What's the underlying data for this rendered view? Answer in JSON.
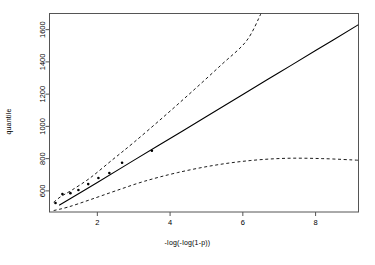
{
  "chart_data": {
    "type": "scatter",
    "title": "",
    "subtitle": "",
    "xlabel": "-log(-log(1-p))",
    "ylabel": "quantile",
    "xlim": [
      0.685,
      9.18
    ],
    "ylim": [
      469,
      1700
    ],
    "grid": false,
    "legend": null,
    "xticks": [
      2,
      4,
      6,
      8
    ],
    "xtick_labels": [
      "2",
      "4",
      "6",
      "8"
    ],
    "yticks": [
      600,
      800,
      1000,
      1200,
      1400,
      1600
    ],
    "ytick_labels": [
      "600",
      "800",
      "1000",
      "1200",
      "1400",
      "1600"
    ],
    "box": true,
    "series": [
      {
        "name": "observed quantiles",
        "type": "scatter",
        "marker": "filled-circle",
        "color": "#000000",
        "points": [
          {
            "x": 0.85,
            "y": 525
          },
          {
            "x": 1.04,
            "y": 580
          },
          {
            "x": 1.26,
            "y": 586
          },
          {
            "x": 1.48,
            "y": 605
          },
          {
            "x": 1.75,
            "y": 642
          },
          {
            "x": 2.03,
            "y": 680
          },
          {
            "x": 2.33,
            "y": 711
          },
          {
            "x": 2.68,
            "y": 774
          },
          {
            "x": 3.5,
            "y": 849
          }
        ]
      },
      {
        "name": "fitted quantile line",
        "type": "line",
        "style": "solid",
        "color": "#000000",
        "x": [
          0.95,
          2.0,
          3.0,
          4.0,
          5.0,
          6.0,
          7.0,
          8.0,
          9.18
        ],
        "y": [
          511,
          652,
          789,
          925,
          1061,
          1198,
          1334,
          1470,
          1631
        ]
      },
      {
        "name": "upper confidence band",
        "type": "line",
        "style": "dashed",
        "color": "#000000",
        "x": [
          0.8,
          1.0,
          1.3,
          1.8,
          2.4,
          3.0,
          3.8,
          4.6,
          5.4,
          6.1,
          6.5
        ],
        "y": [
          530,
          565,
          605,
          680,
          790,
          900,
          1055,
          1215,
          1380,
          1530,
          1700
        ]
      },
      {
        "name": "lower confidence band",
        "type": "line",
        "style": "dashed",
        "color": "#000000",
        "x": [
          0.8,
          1.2,
          1.8,
          2.5,
          3.3,
          4.2,
          5.2,
          6.2,
          7.2,
          8.2,
          9.18
        ],
        "y": [
          478,
          500,
          545,
          600,
          660,
          713,
          758,
          788,
          802,
          800,
          790
        ]
      }
    ]
  },
  "axis": {
    "x_label": "-log(-log(1-p))",
    "y_label": "quantile"
  }
}
